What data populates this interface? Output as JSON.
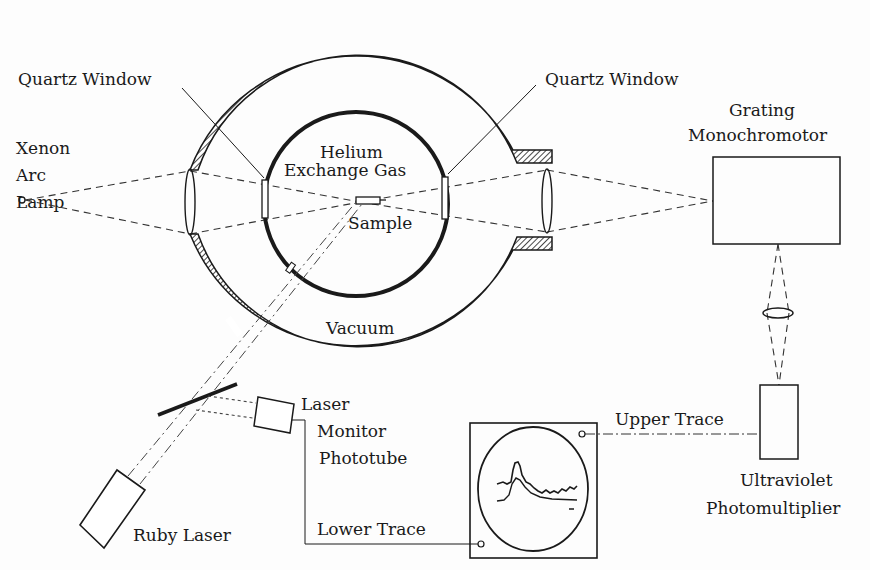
{
  "diagram": {
    "labels": {
      "xenon_lamp": [
        "Xenon",
        "Arc",
        "Lamp"
      ],
      "quartz_window_left": "Quartz Window",
      "quartz_window_right": "Quartz Window",
      "helium_gas": [
        "Helium",
        "Exchange Gas"
      ],
      "sample": "Sample",
      "vacuum": "Vacuum",
      "monochromator": [
        "Grating",
        "Monochromotor"
      ],
      "laser_monitor": [
        "Laser",
        "Monitor",
        "Phototube"
      ],
      "ruby_laser": "Ruby Laser",
      "lower_trace": "Lower Trace",
      "upper_trace": "Upper Trace",
      "photomultiplier": [
        "Ultraviolet",
        "Photomultiplier"
      ]
    },
    "components": [
      "xenon-arc-lamp",
      "entrance-lens",
      "outer-vacuum-vessel",
      "inner-helium-chamber",
      "quartz-window-left",
      "quartz-window-right",
      "sample",
      "exit-lens",
      "grating-monochromator",
      "relay-lens",
      "uv-photomultiplier",
      "ruby-laser",
      "beam-splitter",
      "laser-monitor-phototube",
      "oscilloscope"
    ],
    "colors": {
      "ink": "#1a1a1a",
      "paper": "#fdfdfd"
    }
  }
}
